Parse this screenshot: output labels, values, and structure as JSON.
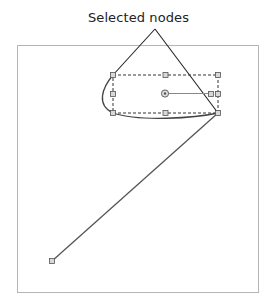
{
  "annotation": {
    "label": "Selected nodes"
  },
  "colors": {
    "frame": "#b5b5b5",
    "line": "#444444",
    "handle_fill": "#d8d8d8",
    "handle_stroke": "#555555",
    "background": "#ffffff"
  },
  "diagram": {
    "frame": {
      "x": 17,
      "y": 45,
      "w": 241,
      "h": 247
    },
    "selection_box": {
      "x": 113,
      "y": 75,
      "w": 105,
      "h": 38
    },
    "rotation_center": {
      "x": 165,
      "y": 93
    },
    "rotation_handle": {
      "x": 211,
      "y": 94
    },
    "end_node": {
      "x": 52,
      "y": 261
    },
    "callout_apex": {
      "x": 155,
      "y": 29
    }
  }
}
